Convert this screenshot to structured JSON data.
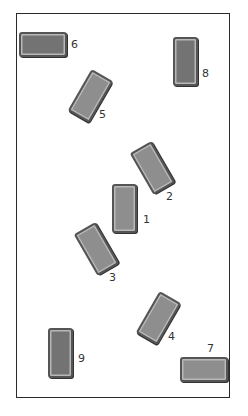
{
  "diagram": {
    "title": "",
    "blocks": [
      {
        "id": "1",
        "label": "1",
        "orientation": "vertical",
        "rotation_deg": 0
      },
      {
        "id": "2",
        "label": "2",
        "orientation": "vertical",
        "rotation_deg": -30
      },
      {
        "id": "3",
        "label": "3",
        "orientation": "vertical",
        "rotation_deg": -30
      },
      {
        "id": "4",
        "label": "4",
        "orientation": "vertical",
        "rotation_deg": 30
      },
      {
        "id": "5",
        "label": "5",
        "orientation": "vertical",
        "rotation_deg": 30
      },
      {
        "id": "6",
        "label": "6",
        "orientation": "horizontal",
        "rotation_deg": 0
      },
      {
        "id": "7",
        "label": "7",
        "orientation": "horizontal",
        "rotation_deg": 0
      },
      {
        "id": "8",
        "label": "8",
        "orientation": "vertical",
        "rotation_deg": 0
      },
      {
        "id": "9",
        "label": "9",
        "orientation": "vertical",
        "rotation_deg": 0
      }
    ],
    "colors": {
      "block_fill": "#8e8e8e",
      "block_border": "#555555",
      "frame": "#2a2a2a"
    }
  }
}
